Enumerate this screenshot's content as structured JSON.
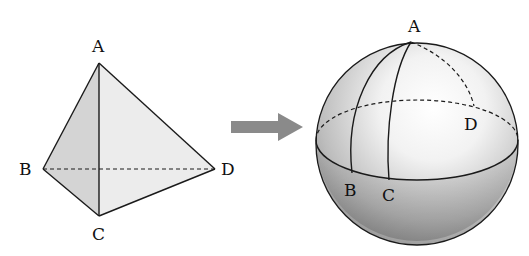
{
  "tetrahedron": {
    "labels": {
      "A": "A",
      "B": "B",
      "C": "C",
      "D": "D"
    }
  },
  "arrow": {
    "meaning": "maps-to",
    "color": "#8a8a8a"
  },
  "sphere": {
    "labels": {
      "A": "A",
      "B": "B",
      "C": "C",
      "D": "D"
    }
  },
  "colors": {
    "face_left": "#d6d6d6",
    "face_right": "#ececec",
    "line": "#1a1a1a"
  }
}
